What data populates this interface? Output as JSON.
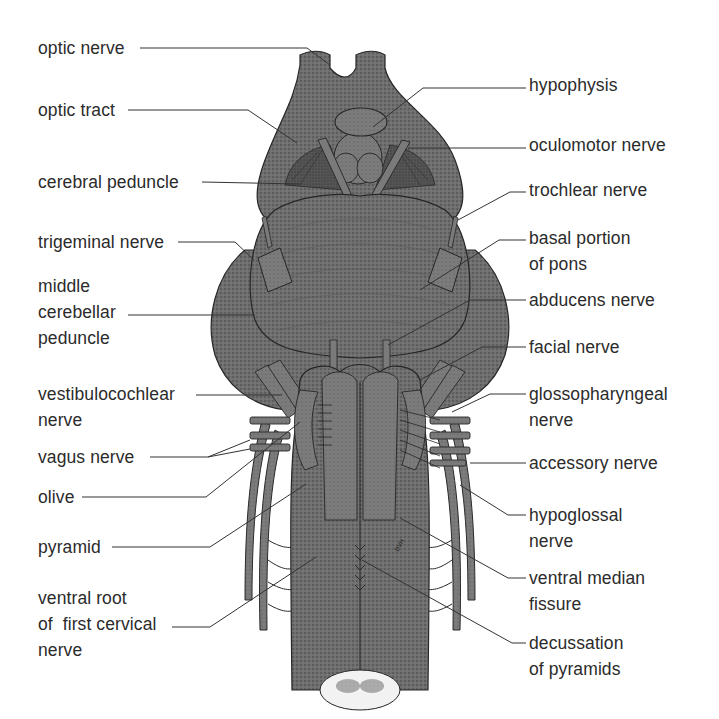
{
  "figure": {
    "signature": "DVH",
    "colors": {
      "background": "#ffffff",
      "tissue": "#6e6e6e",
      "tissue_dark": "#4a4a4a",
      "tissue_light": "#8a8a8a",
      "outline": "#262626",
      "leader_line": "#333333",
      "text": "#2b2b2b",
      "cord_section": "#f2f2f2"
    }
  },
  "labels_left": [
    {
      "id": "optic-nerve",
      "lines": [
        "optic nerve"
      ]
    },
    {
      "id": "optic-tract",
      "lines": [
        "optic tract"
      ]
    },
    {
      "id": "cerebral-peduncle",
      "lines": [
        "cerebral peduncle"
      ]
    },
    {
      "id": "trigeminal-nerve",
      "lines": [
        "trigeminal nerve"
      ]
    },
    {
      "id": "middle-cerebellar-peduncle",
      "lines": [
        "middle",
        "cerebellar",
        "peduncle"
      ]
    },
    {
      "id": "vestibulocochlear-nerve",
      "lines": [
        "vestibulocochlear",
        "nerve"
      ]
    },
    {
      "id": "vagus-nerve",
      "lines": [
        "vagus nerve"
      ]
    },
    {
      "id": "olive",
      "lines": [
        "olive"
      ]
    },
    {
      "id": "pyramid",
      "lines": [
        "pyramid"
      ]
    },
    {
      "id": "ventral-root-first-cervical-nerve",
      "lines": [
        "ventral root",
        "of  first cervical",
        "nerve"
      ]
    }
  ],
  "labels_right": [
    {
      "id": "hypophysis",
      "lines": [
        "hypophysis"
      ]
    },
    {
      "id": "oculomotor-nerve",
      "lines": [
        "oculomotor nerve"
      ]
    },
    {
      "id": "trochlear-nerve",
      "lines": [
        "trochlear nerve"
      ]
    },
    {
      "id": "basal-portion-of-pons",
      "lines": [
        "basal portion",
        "of pons"
      ]
    },
    {
      "id": "abducens-nerve",
      "lines": [
        "abducens nerve"
      ]
    },
    {
      "id": "facial-nerve",
      "lines": [
        "facial nerve"
      ]
    },
    {
      "id": "glossopharyngeal-nerve",
      "lines": [
        "glossopharyngeal",
        "nerve"
      ]
    },
    {
      "id": "accessory-nerve",
      "lines": [
        "accessory nerve"
      ]
    },
    {
      "id": "hypoglossal-nerve",
      "lines": [
        "hypoglossal",
        "nerve"
      ]
    },
    {
      "id": "ventral-median-fissure",
      "lines": [
        "ventral median",
        "fissure"
      ]
    },
    {
      "id": "decussation-of-pyramids",
      "lines": [
        "decussation",
        "of pyramids"
      ]
    }
  ]
}
